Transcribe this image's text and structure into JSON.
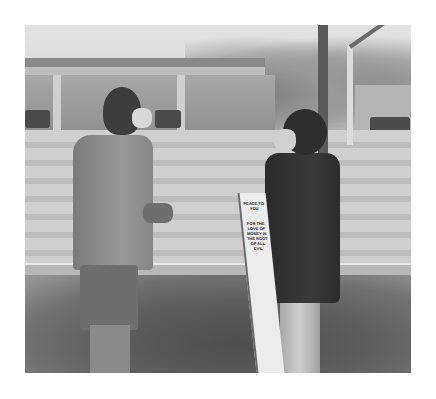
{
  "photo": {
    "description": "Grayscale street photograph: a man in a masked face covering and a woman in a mask holding a protest sign stand talking on a sidewalk; gas station canopy, trees, utility pole and traffic signal in background",
    "tone": "grayscale",
    "sign": {
      "line1": "PEACE TO YOU",
      "line2": "FOR THE LOVE OF MONEY IS THE ROOT OF ALL EVIL"
    }
  }
}
